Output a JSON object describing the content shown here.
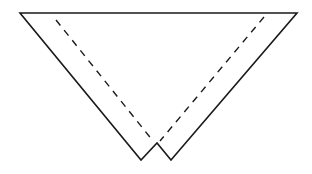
{
  "diagram": {
    "type": "fold-pattern",
    "colors": {
      "background": "#ffffff",
      "stroke": "#1a1a1a"
    },
    "outline_points": [
      [
        20,
        13
      ],
      [
        297,
        13
      ],
      [
        171,
        160
      ],
      [
        157,
        143
      ],
      [
        141,
        160
      ]
    ],
    "fold_lines": [
      {
        "name": "left-fold",
        "from": [
          56,
          20
        ],
        "to": [
          153,
          141
        ],
        "style": "dashed"
      },
      {
        "name": "right-fold",
        "from": [
          264,
          17
        ],
        "to": [
          160,
          141
        ],
        "style": "dashed"
      }
    ]
  }
}
